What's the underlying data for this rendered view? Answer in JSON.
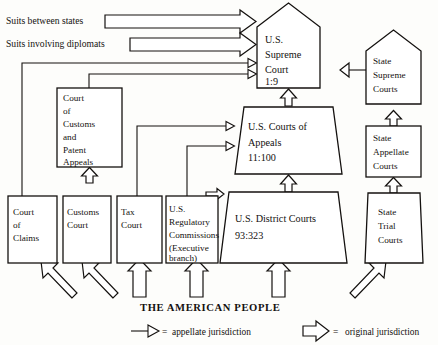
{
  "figure": {
    "people_label": "THE AMERICAN PEOPLE",
    "ink_color": "#14110f",
    "paper_color": "#fdfdfb"
  },
  "side_labels": [
    {
      "id": "suits-between-states",
      "text": "Suits between states"
    },
    {
      "id": "suits-involving-diplomats",
      "text": "Suits involving diplomats"
    }
  ],
  "federal_courts": {
    "supreme": {
      "name": "U.S. Supreme Court",
      "line1": "U.S.",
      "line2": "Supreme",
      "line3": "Court",
      "ratio": "1:9",
      "shape": "pentagon"
    },
    "appeals": {
      "name": "U.S. Courts of Appeals",
      "line1": "U.S. Courts of",
      "line2": "Appeals",
      "ratio": "11:100",
      "shape": "trapezoid"
    },
    "district": {
      "name": "U.S. District Courts",
      "line1": "U.S. District Courts",
      "ratio": "93:323",
      "shape": "trapezoid"
    },
    "ccpa": {
      "name": "Court of Customs and Patent Appeals",
      "lines": [
        "Court",
        "of",
        "Customs",
        "and",
        "Patent",
        "Appeals"
      ],
      "shape": "rectangle"
    }
  },
  "specialized_courts": [
    {
      "id": "court-of-claims",
      "lines": [
        "Court",
        "of",
        "Claims"
      ]
    },
    {
      "id": "customs-court",
      "lines": [
        "Customs",
        "Court"
      ]
    },
    {
      "id": "tax-court",
      "lines": [
        "Tax",
        "Court"
      ]
    },
    {
      "id": "regulatory-commissions",
      "lines": [
        "U.S.",
        "Regulatory",
        "Commissions",
        "(Executive",
        "branch)"
      ]
    }
  ],
  "state_courts": [
    {
      "id": "state-supreme-courts",
      "lines": [
        "State",
        "Supreme",
        "Courts"
      ],
      "shape": "pentagon"
    },
    {
      "id": "state-appellate-courts",
      "lines": [
        "State",
        "Appellate",
        "Courts"
      ],
      "shape": "rectangle"
    },
    {
      "id": "state-trial-courts",
      "lines": [
        "State",
        "Trial",
        "Courts"
      ],
      "shape": "trapezoid"
    }
  ],
  "legend": {
    "appellate": {
      "symbol": "thin-line-arrow",
      "equals": "=",
      "text": "appellate jurisdiction"
    },
    "original": {
      "symbol": "hollow-block-arrow",
      "equals": "=",
      "text": "original jurisdiction"
    }
  }
}
